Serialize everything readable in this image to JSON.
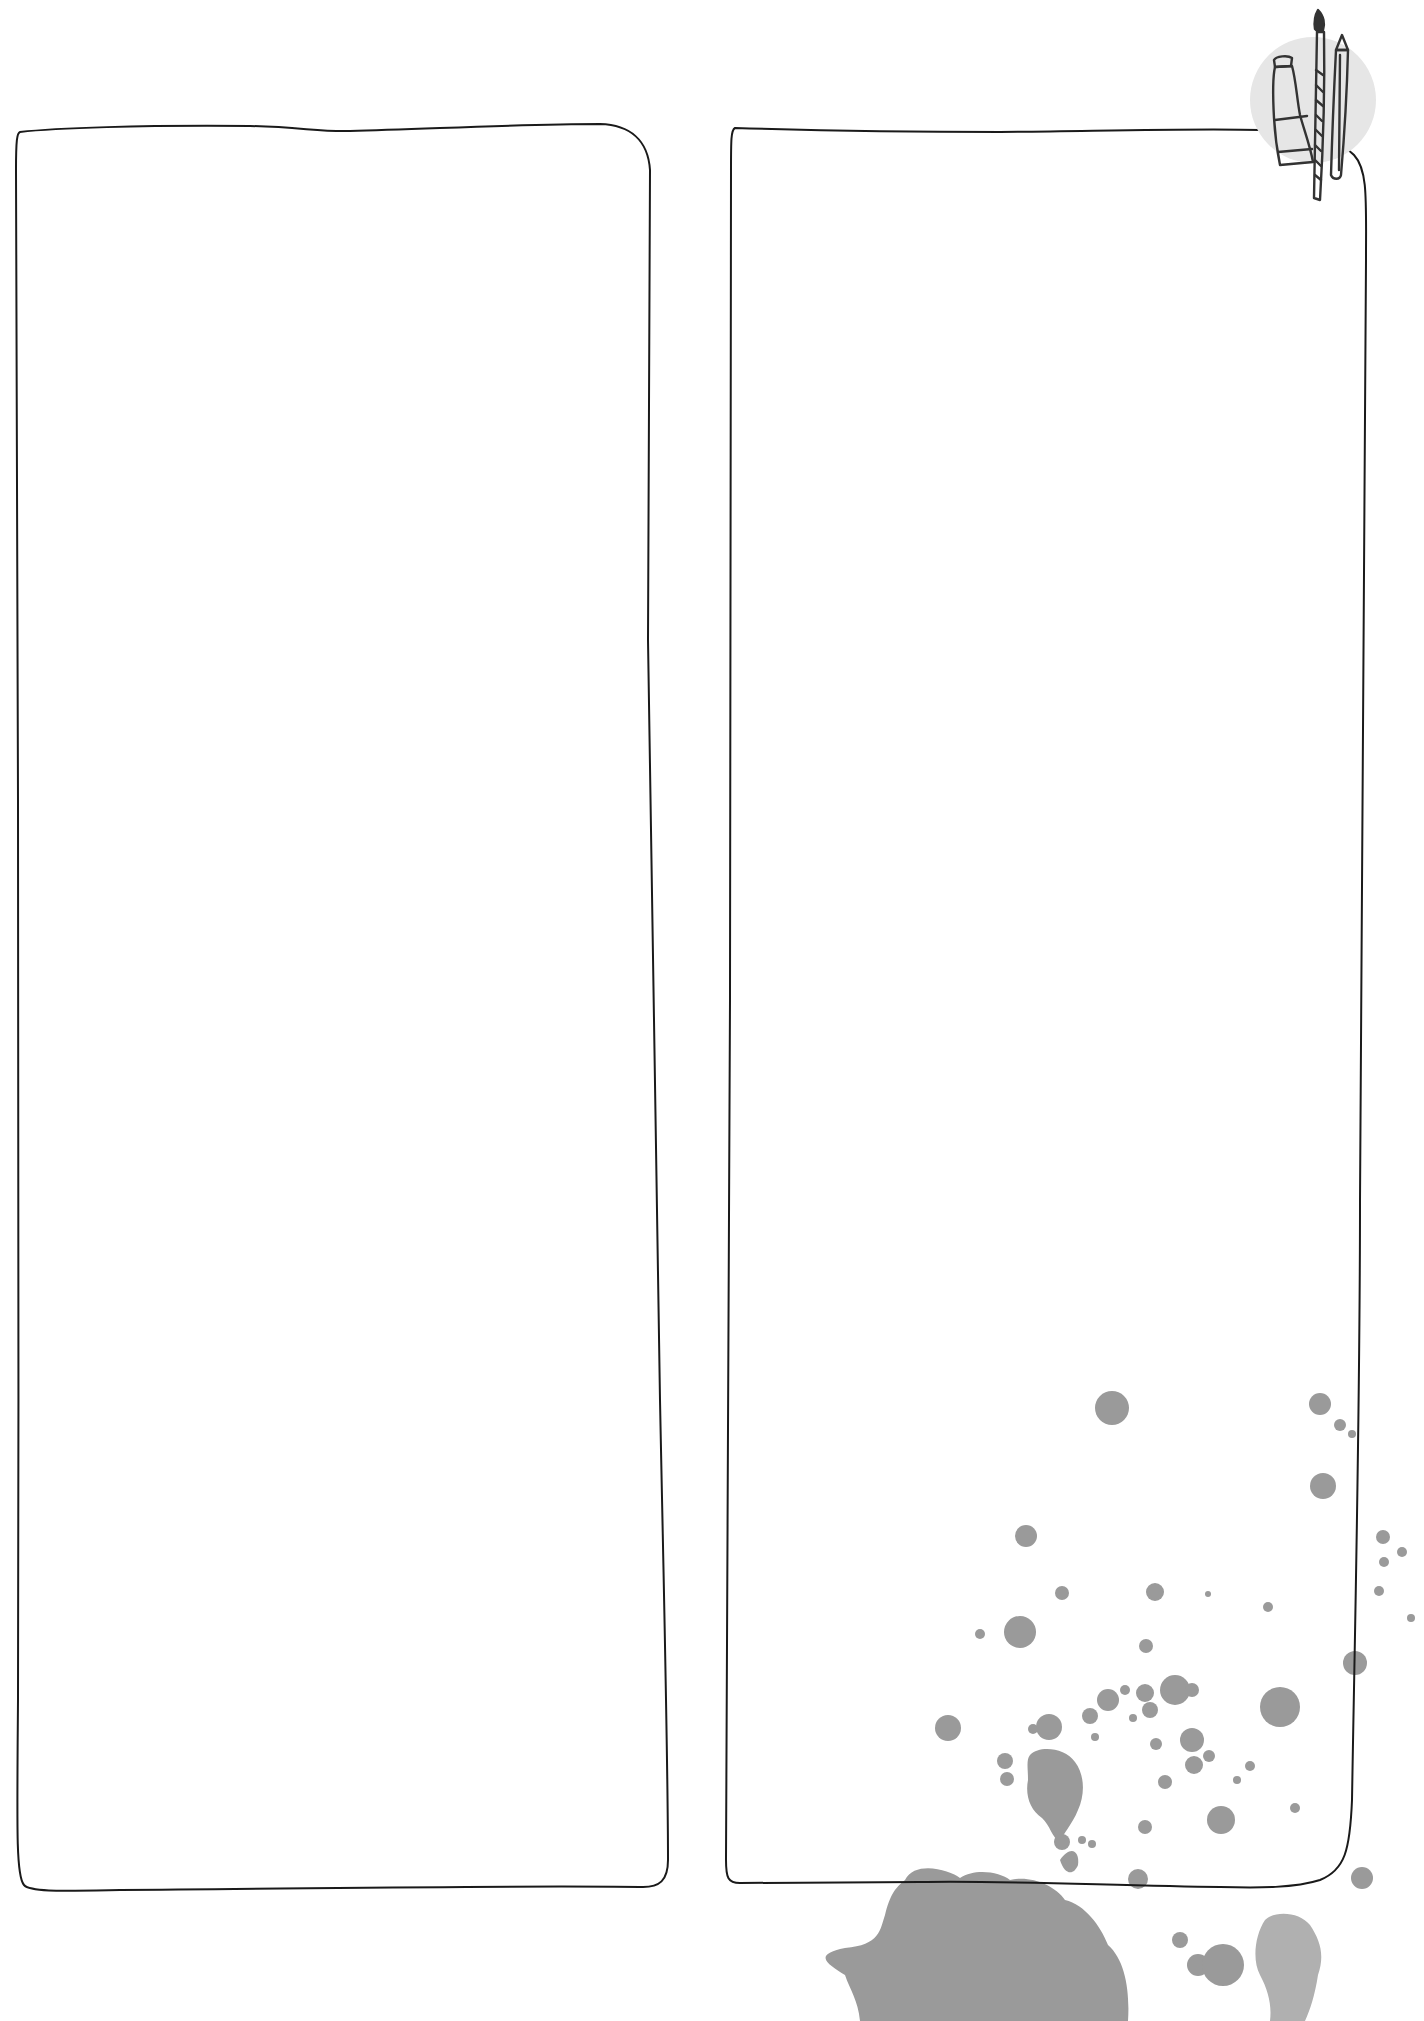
{
  "page": {
    "background": "#ffffff",
    "kind": "blank two-panel journal page"
  },
  "frames": [
    {
      "id": "left-frame",
      "label": ""
    },
    {
      "id": "right-frame",
      "label": ""
    }
  ],
  "decorations": {
    "art_supplies_icon": {
      "description": "paint tube, paintbrush and pencil over a light grey circle",
      "circle_color": "#e6e6e6",
      "stroke_color": "#333333"
    },
    "ink_splatter": {
      "color": "#9a9a9a",
      "light_color": "#b0b0b0"
    }
  },
  "colors": {
    "frame_stroke": "#1a1a1a"
  }
}
